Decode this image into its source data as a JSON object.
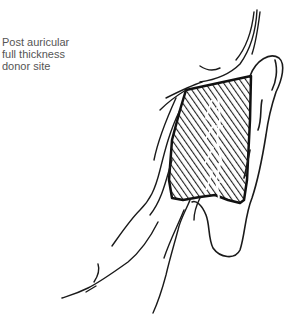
{
  "annotation": {
    "lines": [
      "Post auricular",
      "full thickness",
      "donor site"
    ]
  },
  "illustration": {
    "subject": "ear-posterior-view-with-donor-site",
    "stroke_color": "#1a1a1a",
    "hatch_color": "#222222",
    "background": "#ffffff"
  }
}
